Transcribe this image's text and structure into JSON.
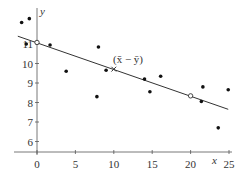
{
  "chart_data": {
    "type": "scatter",
    "title": "",
    "xlabel": "x",
    "ylabel": "y",
    "xlim": [
      -3,
      25.5
    ],
    "ylim": [
      5.4,
      12.8
    ],
    "grid": false,
    "x_ticks": [
      0,
      5,
      10,
      15,
      20,
      25
    ],
    "y_ticks": [
      6,
      7,
      8,
      9,
      10,
      11
    ],
    "series": [
      {
        "name": "data points",
        "marker": "filled-dot",
        "points": [
          {
            "x": -2.0,
            "y": 12.1
          },
          {
            "x": -1.0,
            "y": 12.3
          },
          {
            "x": -1.4,
            "y": 11.0
          },
          {
            "x": 1.7,
            "y": 10.95
          },
          {
            "x": 3.8,
            "y": 9.6
          },
          {
            "x": 8.0,
            "y": 10.85
          },
          {
            "x": 7.8,
            "y": 8.3
          },
          {
            "x": 9.0,
            "y": 9.65
          },
          {
            "x": 14.0,
            "y": 9.2
          },
          {
            "x": 14.7,
            "y": 8.55
          },
          {
            "x": 16.1,
            "y": 9.35
          },
          {
            "x": 21.6,
            "y": 8.8
          },
          {
            "x": 21.4,
            "y": 8.05
          },
          {
            "x": 23.6,
            "y": 6.7
          },
          {
            "x": 24.9,
            "y": 8.65
          }
        ]
      },
      {
        "name": "regression line",
        "type": "line",
        "points": [
          {
            "x": -2.5,
            "y": 11.4
          },
          {
            "x": 24.9,
            "y": 7.65
          }
        ]
      },
      {
        "name": "line reference points",
        "marker": "open-circle",
        "points": [
          {
            "x": 0,
            "y": 11.08
          },
          {
            "x": 20,
            "y": 8.34
          }
        ]
      },
      {
        "name": "mean point",
        "marker": "cross",
        "points": [
          {
            "x": 10,
            "y": 9.71
          }
        ]
      }
    ],
    "annotations": [
      {
        "text": "(x̄ − ȳ)",
        "x": 10.2,
        "y": 10.15
      }
    ],
    "legend": null
  },
  "axes": {
    "x_label": "x",
    "y_label": "y",
    "x_tick_labels": [
      "0",
      "5",
      "10",
      "15",
      "20",
      "25"
    ],
    "y_tick_labels": [
      "6",
      "7",
      "8",
      "9",
      "10",
      "11"
    ]
  },
  "annotation": {
    "mean_label": "(x̄ − ȳ)"
  },
  "colors": {
    "axis": "#555555",
    "points": "#111111",
    "line": "#333333",
    "text": "#333333"
  }
}
